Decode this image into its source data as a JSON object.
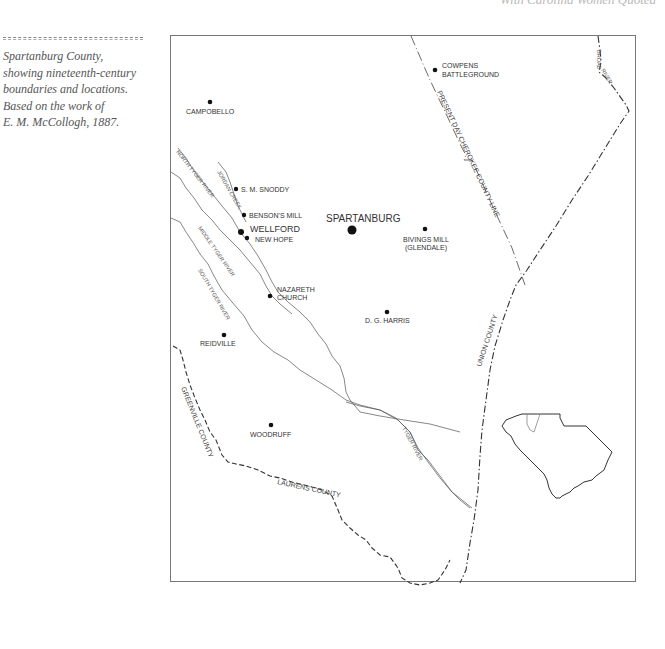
{
  "running_head": "With Carolina Women Quoted",
  "caption": {
    "lines": [
      "Spartanburg County,",
      "showing nineteenth-century",
      "boundaries and locations.",
      "Based on the work of",
      "E. M. McCollogh, 1887."
    ]
  },
  "map": {
    "places": [
      {
        "name": "COWPENS",
        "name2": "BATTLEGROUND"
      },
      {
        "name": "CAMPOBELLO"
      },
      {
        "name": "S. M. SNODDY"
      },
      {
        "name": "BENSON'S MILL"
      },
      {
        "name": "WELLFORD"
      },
      {
        "name": "NEW HOPE"
      },
      {
        "name": "SPARTANBURG"
      },
      {
        "name": "BIVINGS MILL",
        "name2": "(GLENDALE)"
      },
      {
        "name": "NAZARETH",
        "name2": "CHURCH"
      },
      {
        "name": "D. G. HARRIS"
      },
      {
        "name": "REIDVILLE"
      },
      {
        "name": "WOODRUFF"
      }
    ],
    "rivers": {
      "north_tyger": "NORTH TYGER RIVER",
      "jordan_creek": "JORDAN CREEK",
      "middle_tyger": "MIDDLE TYGER RIVER",
      "south_tyger": "SOUTH TYGER RIVER",
      "tyger": "TYGER RIVER",
      "broad": "BROAD",
      "broad2": "RIVER"
    },
    "boundaries": {
      "cherokee": "PRESENT DAY CHEROKEE COUNTY LINE",
      "union": "UNION COUNTY",
      "greenville": "GREENVILLE COUNTY",
      "laurens": "LAURENS COUNTY"
    },
    "inset": "South Carolina state outline with Spartanburg County highlighted"
  }
}
